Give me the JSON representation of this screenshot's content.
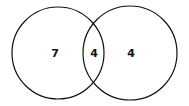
{
  "diagram": {
    "type": "venn",
    "sets": [
      {
        "name": "left-set",
        "only_count": "7"
      },
      {
        "name": "right-set",
        "only_count": "4"
      }
    ],
    "intersection_count": "4",
    "colors": {
      "stroke": "#111111",
      "background": "#ffffff"
    }
  }
}
